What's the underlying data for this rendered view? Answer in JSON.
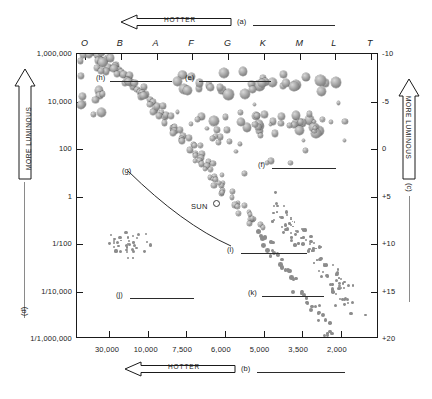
{
  "figure": {
    "sun_label": "SUN",
    "top_arrow": {
      "text": "HOTTER",
      "key": "(a)"
    },
    "bottom_arrow": {
      "text": "HOTTER",
      "key": "(b)"
    },
    "left_arrow": {
      "text": "MORE LUMINOUS",
      "key": "(d)"
    },
    "right_arrow": {
      "text": "MORE LUMINOUS",
      "key": "(c)"
    }
  },
  "axes": {
    "spectral_classes": [
      "O",
      "B",
      "A",
      "F",
      "G",
      "K",
      "M",
      "L",
      "T"
    ],
    "luminosity_labels": [
      "1,000,000",
      "10,000",
      "100",
      "1",
      "1/100",
      "1/10,000",
      "1/1,000,000"
    ],
    "magnitude_labels": [
      "-10",
      "-5",
      "0",
      "+5",
      "+10",
      "+15",
      "+20"
    ],
    "temperature_labels": [
      "30,000",
      "10,000",
      "7,500",
      "6,000",
      "5,000",
      "3,500",
      "2,000"
    ]
  },
  "callouts": [
    {
      "key": "(e)",
      "x": 185,
      "y": 73,
      "line": 72
    },
    {
      "key": "(f)",
      "x": 258,
      "y": 160,
      "line": 64
    },
    {
      "key": "(g)",
      "x": 122,
      "y": 166,
      "curve": true
    },
    {
      "key": "(h)",
      "x": 96,
      "y": 73,
      "line": 62
    },
    {
      "key": "(i)",
      "x": 227,
      "y": 245,
      "line": 66
    },
    {
      "key": "(j)",
      "x": 116,
      "y": 290,
      "line": 64
    },
    {
      "key": "(k)",
      "x": 248,
      "y": 288,
      "line": 62
    }
  ],
  "chart_data": {
    "type": "scatter",
    "xlabel": "Surface temperature (K) / Spectral class",
    "ylabel": "Luminosity (Sun = 1) / Absolute magnitude",
    "grid": false,
    "legend": "none",
    "x_axis_top": {
      "name": "Spectral class",
      "ticks": [
        "O",
        "B",
        "A",
        "F",
        "G",
        "K",
        "M",
        "L",
        "T"
      ]
    },
    "x_axis_bottom": {
      "name": "Surface temperature (K)",
      "ticks": [
        30000,
        10000,
        7500,
        6000,
        5000,
        3500,
        2000
      ],
      "direction": "decreasing"
    },
    "y_axis_left": {
      "name": "Luminosity (Sun = 1)",
      "scale": "log",
      "ticks": [
        "1,000,000",
        "10,000",
        "100",
        "1",
        "1/100",
        "1/10,000",
        "1/1,000,000"
      ]
    },
    "y_axis_right": {
      "name": "Absolute magnitude",
      "ticks": [
        -10,
        -5,
        0,
        5,
        10,
        15,
        20
      ],
      "direction": "decreasing_up"
    },
    "annotations": [
      {
        "label": "SUN",
        "x": 5800,
        "y": 1,
        "magnitude": 4.8
      },
      {
        "key": "(a)",
        "text": "HOTTER (top axis direction)"
      },
      {
        "key": "(b)",
        "text": "HOTTER (bottom axis direction)"
      },
      {
        "key": "(c)",
        "text": "MORE LUMINOUS (right axis direction)"
      },
      {
        "key": "(d)",
        "text": "MORE LUMINOUS (left axis direction)"
      },
      {
        "key": "(e)",
        "text": "supergiants region"
      },
      {
        "key": "(f)",
        "text": "giants region"
      },
      {
        "key": "(g)",
        "text": "main sequence"
      },
      {
        "key": "(h)",
        "text": "hot luminous blue stars"
      },
      {
        "key": "(i)",
        "text": "main sequence lower branch"
      },
      {
        "key": "(j)",
        "text": "white dwarfs"
      },
      {
        "key": "(k)",
        "text": "red dwarfs"
      }
    ],
    "groups": [
      {
        "name": "main-sequence",
        "marker": "sphere",
        "count": 150
      },
      {
        "name": "supergiants",
        "marker": "sphere-large",
        "count": 30
      },
      {
        "name": "giants",
        "marker": "sphere-large",
        "count": 26
      },
      {
        "name": "white-dwarfs",
        "marker": "dot",
        "count": 34
      },
      {
        "name": "red-dwarfs",
        "marker": "dot",
        "count": 95
      }
    ]
  }
}
